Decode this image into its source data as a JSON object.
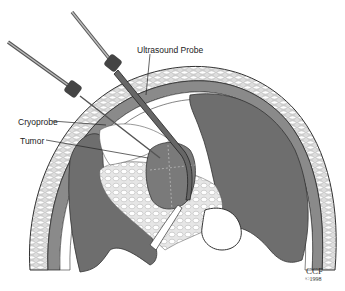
{
  "figure": {
    "type": "medical-illustration",
    "labels": {
      "ultrasound_probe": "Ultrasound Probe",
      "cryoprobe": "Cryoprobe",
      "tumor": "Tumor"
    },
    "credit": {
      "org": "CCF",
      "copyright": "©1998"
    },
    "colors": {
      "organ_dark": "#6e6e6e",
      "organ_mid": "#8a8a8a",
      "fat_pattern": "#d9d9d9",
      "outline": "#333333",
      "background": "#ffffff"
    }
  }
}
